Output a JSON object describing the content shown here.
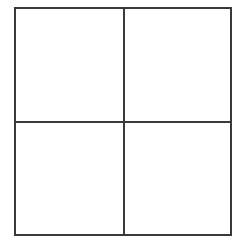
{
  "figure": {
    "title": "",
    "type": "2x2-grid",
    "background_color": "#ffffff",
    "line_color": "#3a3a3a",
    "line_width_px": 2,
    "outer_square": {
      "left_px": 14,
      "top_px": 7,
      "width_px": 218,
      "height_px": 229
    },
    "dividers": {
      "vertical_x_px": 123,
      "horizontal_y_px": 121
    },
    "cells": [
      {
        "id": "top-left",
        "label": "",
        "fill": "#ffffff"
      },
      {
        "id": "top-right",
        "label": "",
        "fill": "#ffffff"
      },
      {
        "id": "bottom-left",
        "label": "",
        "fill": "#ffffff"
      },
      {
        "id": "bottom-right",
        "label": "",
        "fill": "#ffffff"
      }
    ]
  }
}
